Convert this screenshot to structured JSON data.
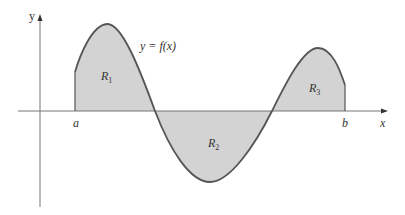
{
  "diagram": {
    "axes": {
      "x_label": "x",
      "y_label": "y"
    },
    "curve_label": "y = f(x)",
    "interval": {
      "start": "a",
      "end": "b"
    },
    "regions": [
      {
        "name": "R",
        "sub": "1",
        "position": "above x-axis"
      },
      {
        "name": "R",
        "sub": "2",
        "position": "below x-axis"
      },
      {
        "name": "R",
        "sub": "3",
        "position": "above x-axis"
      }
    ],
    "colors": {
      "fill": "#d3d3d3",
      "curve": "#555555",
      "axis": "#666666"
    }
  }
}
